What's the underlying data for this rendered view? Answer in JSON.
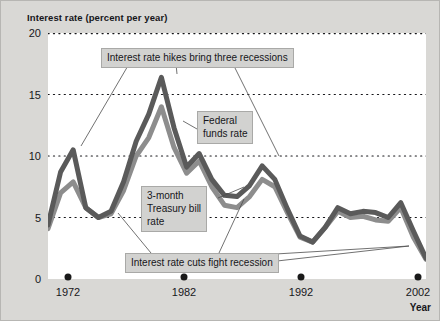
{
  "chart_data": {
    "type": "line",
    "title": "Interest rate (percent per year)",
    "xlabel": "Year",
    "ylabel": "Interest rate (percent per year)",
    "xlim": [
      1972,
      2002
    ],
    "ylim": [
      0,
      20
    ],
    "yticks": [
      0,
      5,
      10,
      15,
      20
    ],
    "ytick_labels": [
      "0",
      "5",
      "10",
      "15",
      "20"
    ],
    "xticks": [
      1972,
      1982,
      1992,
      2002
    ],
    "xtick_labels": [
      "1972",
      "1982",
      "1992",
      "2002"
    ],
    "grid": "horizontal dotted gridlines at 5, 10, 15, 20",
    "legend": "inline labels with leader lines",
    "x": [
      1972,
      1973,
      1974,
      1975,
      1976,
      1977,
      1978,
      1979,
      1980,
      1981,
      1982,
      1983,
      1984,
      1985,
      1986,
      1987,
      1988,
      1989,
      1990,
      1991,
      1992,
      1993,
      1994,
      1995,
      1996,
      1997,
      1998,
      1999,
      2000,
      2001,
      2002
    ],
    "series": [
      {
        "name": "Federal funds rate",
        "color": "#5a5a5a",
        "values": [
          4.4,
          8.7,
          10.5,
          5.8,
          5.0,
          5.5,
          7.9,
          11.2,
          13.4,
          16.4,
          12.3,
          9.1,
          10.2,
          8.1,
          6.8,
          6.7,
          7.6,
          9.2,
          8.1,
          5.7,
          3.5,
          3.0,
          4.2,
          5.8,
          5.3,
          5.5,
          5.4,
          5.0,
          6.2,
          3.9,
          1.7
        ]
      },
      {
        "name": "3-month Treasury bill rate",
        "color": "#8d8d8d",
        "values": [
          4.1,
          7.0,
          7.9,
          5.8,
          5.0,
          5.3,
          7.2,
          10.0,
          11.5,
          14.0,
          10.7,
          8.6,
          9.6,
          7.5,
          6.0,
          5.8,
          6.7,
          8.1,
          7.5,
          5.4,
          3.4,
          3.0,
          4.2,
          5.5,
          5.0,
          5.1,
          4.8,
          4.7,
          5.8,
          3.4,
          1.6
        ]
      }
    ],
    "annotations": [
      {
        "id": "hikes",
        "text": "Interest rate hikes bring three recessions",
        "lines": [
          "Interest rate hikes bring three recessions"
        ]
      },
      {
        "id": "federal",
        "text": "Federal funds rate",
        "lines": [
          "Federal",
          "funds rate"
        ]
      },
      {
        "id": "tbill",
        "text": "3-month Treasury bill rate",
        "lines": [
          "3-month",
          "Treasury bill",
          "rate"
        ]
      },
      {
        "id": "cuts",
        "text": "Interest rate cuts fight recession",
        "lines": [
          "Interest rate cuts fight recession"
        ]
      }
    ]
  }
}
